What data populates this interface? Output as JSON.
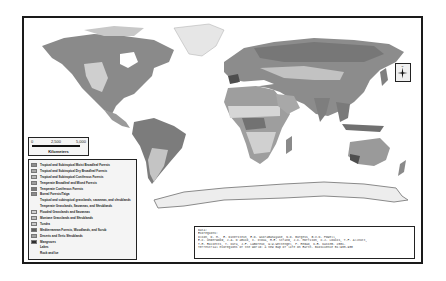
{
  "map": {
    "title": "",
    "transcription_note": "Legend labels and citation text were not legible in the screenshot; they are reconstructed from the standard WWF terrestrial ecoregions map and the Olson et al. 2001 citation, not read from the pixels.",
    "scale_bar": {
      "ticks": [
        "0",
        "2,500",
        "5,000"
      ],
      "unit": "Kilometers"
    },
    "north_arrow": {
      "icon": "compass-rose-icon",
      "label": "N"
    },
    "legend": {
      "items": [
        {
          "label": "Tropical and Subtropical Moist Broadleaf Forests",
          "color": "#8e8e8e"
        },
        {
          "label": "Tropical and Subtropical Dry Broadleaf Forests",
          "color": "#a9a9a9"
        },
        {
          "label": "Tropical and Subtropical Coniferous Forests",
          "color": "#b8b8b8"
        },
        {
          "label": "Temperate Broadleaf and Mixed Forests",
          "color": "#9c9c9c"
        },
        {
          "label": "Temperate Coniferous Forests",
          "color": "#7a7a7a"
        },
        {
          "label": "Boreal Forests/Taiga",
          "color": "#8a8a8a"
        },
        {
          "label": "Tropical and subtropical grasslands, savannas, and shrublands",
          "color": ""
        },
        {
          "label": "Temperate Grasslands, Savannas, and Shrublands",
          "color": ""
        },
        {
          "label": "Flooded Grasslands and Savannas",
          "color": "#d0d0d0"
        },
        {
          "label": "Montane Grasslands and Shrublands",
          "color": "#bdbdbd"
        },
        {
          "label": "Tundra",
          "color": "#c8c8c8"
        },
        {
          "label": "Mediterranean Forests, Woodlands, and Scrub",
          "color": "#5e5e5e"
        },
        {
          "label": "Deserts and Xeric Shrublands",
          "color": "#a0a0a0"
        },
        {
          "label": "Mangroves",
          "color": "#2e2e2e"
        },
        {
          "label": "Lakes",
          "color": ""
        },
        {
          "label": "Rock and Ice",
          "color": ""
        }
      ]
    },
    "citation": {
      "lines": [
        "Data:",
        "",
        "Ecoregions:",
        "Olson, D. M., E. Dinerstein, E.D. Wikramanayake, N.D. Burgess, G.V.N. Powell,",
        "E.C. Underwood, J.A. D'amico, I. Itoua, H.E. Strand, J.C. Morrison, C.J. Loucks, T.F. Allnutt,",
        "T.H. Ricketts, Y. Kura, J.F. Lamoreux, W.W.Wettengel, P. Hedao, K.R. Kassem. 2001.",
        "Terrestrial ecoregions of the world: a new map of life on Earth. Bioscience 51:933-938"
      ]
    },
    "colors": {
      "frame": "#1a1a1a",
      "ocean": "#ffffff",
      "land_dark": "#7c7c7c",
      "land_mid": "#9a9a9a",
      "land_light": "#cfcfcf",
      "ice": "#ededed",
      "antarctica_outline": "#8a8a8a"
    }
  }
}
